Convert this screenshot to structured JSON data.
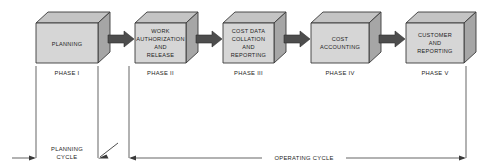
{
  "diagram": {
    "colors": {
      "box_front": "#d6d6d6",
      "box_top": "#c4c4c4",
      "box_side": "#a6a6a6",
      "box_outline": "#3a3a3a",
      "flow_arrow": "#4d4d4d",
      "rule_line": "#4a4a4a",
      "text": "#1d1d1d",
      "background": "#ffffff"
    },
    "stages": [
      {
        "id": "planning",
        "lines": [
          "PLANNING"
        ],
        "phase": "PHASE I"
      },
      {
        "id": "work-authorization-and-release",
        "lines": [
          "WORK",
          "AUTHORIZATION",
          "AND",
          "RELEASE"
        ],
        "phase": "PHASE II"
      },
      {
        "id": "cost-data-collation-and-reporting",
        "lines": [
          "COST DATA",
          "COLLATION",
          "AND",
          "REPORTING"
        ],
        "phase": "PHASE III"
      },
      {
        "id": "cost-accounting",
        "lines": [
          "COST",
          "ACCOUNTING"
        ],
        "phase": "PHASE IV"
      },
      {
        "id": "customer-and-reporting",
        "lines": [
          "CUSTOMER",
          "AND",
          "REPORTING"
        ],
        "phase": "PHASE V"
      }
    ],
    "cycles": [
      {
        "id": "planning-cycle",
        "label_lines": [
          "PLANNING",
          "CYCLE"
        ],
        "spans_phases": [
          "PHASE I"
        ]
      },
      {
        "id": "operating-cycle",
        "label_lines": [
          "OPERATING CYCLE"
        ],
        "spans_phases": [
          "PHASE II",
          "PHASE III",
          "PHASE IV",
          "PHASE V"
        ]
      }
    ],
    "flow_arrow_count": 4
  }
}
